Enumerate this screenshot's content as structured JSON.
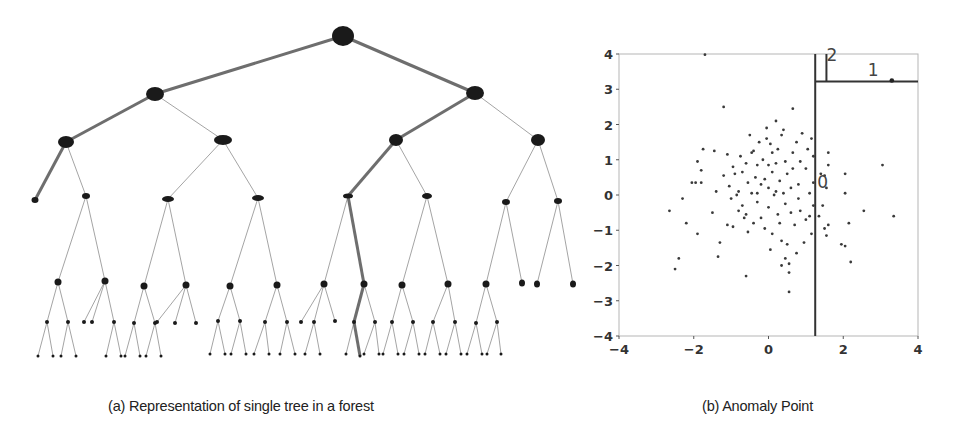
{
  "figure": {
    "caption_a": "(a) Representation of single tree in a forest",
    "caption_b": "(b) Anomaly Point"
  },
  "tree": {
    "description": "Binary isolation tree; highlighted (thick) paths show short path to isolated anomaly and deep path to normal point",
    "edge_color": "#9a9a9a",
    "highlight_color": "#6e6e6e",
    "node_color": "#1a1a1a",
    "nodes": [
      {
        "id": "r",
        "x": 343,
        "y": 36,
        "rx": 11,
        "ry": 10
      },
      {
        "id": "a",
        "x": 155,
        "y": 94,
        "rx": 9,
        "ry": 7,
        "parent": "r",
        "hl": true
      },
      {
        "id": "b",
        "x": 475,
        "y": 93,
        "rx": 9,
        "ry": 7,
        "parent": "r",
        "hl": true
      },
      {
        "id": "aa",
        "x": 66,
        "y": 142,
        "rx": 8,
        "ry": 6,
        "parent": "a",
        "hl": true
      },
      {
        "id": "ab",
        "x": 223,
        "y": 140,
        "rx": 9,
        "ry": 5,
        "parent": "a"
      },
      {
        "id": "ba",
        "x": 396,
        "y": 140,
        "rx": 7,
        "ry": 6,
        "parent": "b",
        "hl": true
      },
      {
        "id": "bb",
        "x": 538,
        "y": 140,
        "rx": 7,
        "ry": 6,
        "parent": "b"
      },
      {
        "id": "aaa",
        "x": 35,
        "y": 200,
        "rx": 3.5,
        "ry": 3,
        "parent": "aa",
        "hl": true
      },
      {
        "id": "aab",
        "x": 86,
        "y": 196,
        "rx": 4,
        "ry": 3,
        "parent": "aa"
      },
      {
        "id": "aba",
        "x": 168,
        "y": 199,
        "rx": 6,
        "ry": 3,
        "parent": "ab"
      },
      {
        "id": "abb",
        "x": 258,
        "y": 198,
        "rx": 6,
        "ry": 3,
        "parent": "ab"
      },
      {
        "id": "baa",
        "x": 348,
        "y": 196,
        "rx": 5,
        "ry": 2.5,
        "parent": "ba",
        "hl": true
      },
      {
        "id": "bab",
        "x": 427,
        "y": 196,
        "rx": 5,
        "ry": 3,
        "parent": "ba"
      },
      {
        "id": "bba",
        "x": 506,
        "y": 202,
        "rx": 4,
        "ry": 3,
        "parent": "bb"
      },
      {
        "id": "bbb",
        "x": 558,
        "y": 201,
        "rx": 4,
        "ry": 3,
        "parent": "bb"
      },
      {
        "id": "n1",
        "x": 58,
        "y": 282,
        "rx": 3.5,
        "ry": 3.5,
        "parent": "aab"
      },
      {
        "id": "n2",
        "x": 105,
        "y": 281,
        "rx": 3.5,
        "ry": 3.5,
        "parent": "aab"
      },
      {
        "id": "n3",
        "x": 144,
        "y": 286,
        "rx": 3.5,
        "ry": 3.5,
        "parent": "aba"
      },
      {
        "id": "n4",
        "x": 186,
        "y": 285,
        "rx": 3.5,
        "ry": 3.5,
        "parent": "aba"
      },
      {
        "id": "n5",
        "x": 230,
        "y": 286,
        "rx": 3.5,
        "ry": 3.5,
        "parent": "abb"
      },
      {
        "id": "n6",
        "x": 277,
        "y": 285,
        "rx": 3.5,
        "ry": 3.5,
        "parent": "abb"
      },
      {
        "id": "n7",
        "x": 324,
        "y": 284,
        "rx": 3.5,
        "ry": 3.5,
        "parent": "baa"
      },
      {
        "id": "n8",
        "x": 364,
        "y": 284,
        "rx": 3.5,
        "ry": 3.5,
        "parent": "baa",
        "hl": true
      },
      {
        "id": "n9",
        "x": 402,
        "y": 285,
        "rx": 3.5,
        "ry": 3.5,
        "parent": "bab"
      },
      {
        "id": "n10",
        "x": 448,
        "y": 284,
        "rx": 3.5,
        "ry": 3.5,
        "parent": "bab"
      },
      {
        "id": "n11",
        "x": 486,
        "y": 284,
        "rx": 3.5,
        "ry": 3.5,
        "parent": "bba"
      },
      {
        "id": "n12",
        "x": 522,
        "y": 283,
        "rx": 3,
        "ry": 3.5,
        "parent": "bba"
      },
      {
        "id": "n13",
        "x": 537,
        "y": 284,
        "rx": 3,
        "ry": 3.5,
        "parent": "bbb"
      },
      {
        "id": "n14",
        "x": 573,
        "y": 284,
        "rx": 3,
        "ry": 3.5,
        "parent": "bbb"
      },
      {
        "id": "m1",
        "x": 47,
        "y": 322,
        "r": 2,
        "parent": "n1"
      },
      {
        "id": "m2",
        "x": 68,
        "y": 322,
        "r": 2,
        "parent": "n1"
      },
      {
        "id": "m3",
        "x": 92,
        "y": 322,
        "r": 2,
        "parent": "n2"
      },
      {
        "id": "m4",
        "x": 114,
        "y": 322,
        "r": 2,
        "parent": "n2"
      },
      {
        "id": "m5",
        "x": 134,
        "y": 323,
        "r": 2,
        "parent": "n3"
      },
      {
        "id": "m6",
        "x": 155,
        "y": 323,
        "r": 2,
        "parent": "n3"
      },
      {
        "id": "m7",
        "x": 175,
        "y": 323,
        "r": 2,
        "parent": "n4"
      },
      {
        "id": "m8",
        "x": 196,
        "y": 323,
        "r": 2,
        "parent": "n4"
      },
      {
        "id": "m9",
        "x": 218,
        "y": 321,
        "r": 2,
        "parent": "n5"
      },
      {
        "id": "m10",
        "x": 240,
        "y": 321,
        "r": 2,
        "parent": "n5"
      },
      {
        "id": "m11",
        "x": 265,
        "y": 322,
        "r": 2,
        "parent": "n6"
      },
      {
        "id": "m12",
        "x": 287,
        "y": 322,
        "r": 2,
        "parent": "n6"
      },
      {
        "id": "m13",
        "x": 314,
        "y": 322,
        "r": 2,
        "parent": "n7"
      },
      {
        "id": "m14",
        "x": 335,
        "y": 321,
        "r": 2,
        "parent": "n7"
      },
      {
        "id": "m15",
        "x": 354,
        "y": 322,
        "r": 2,
        "parent": "n8",
        "hl": true
      },
      {
        "id": "m16",
        "x": 375,
        "y": 322,
        "r": 2,
        "parent": "n8"
      },
      {
        "id": "m17",
        "x": 392,
        "y": 322,
        "r": 2,
        "parent": "n9"
      },
      {
        "id": "m18",
        "x": 413,
        "y": 322,
        "r": 2,
        "parent": "n9"
      },
      {
        "id": "m19",
        "x": 433,
        "y": 322,
        "r": 2,
        "parent": "n10"
      },
      {
        "id": "m20",
        "x": 455,
        "y": 322,
        "r": 2,
        "parent": "n10"
      },
      {
        "id": "m21",
        "x": 476,
        "y": 323,
        "r": 2,
        "parent": "n11"
      },
      {
        "id": "m22",
        "x": 497,
        "y": 322,
        "r": 2,
        "parent": "n11"
      },
      {
        "id": "k1",
        "x": 38,
        "y": 356,
        "r": 1.5,
        "parent": "m1"
      },
      {
        "id": "k2",
        "x": 53,
        "y": 356,
        "r": 1.5,
        "parent": "m1"
      },
      {
        "id": "k3",
        "x": 61,
        "y": 356,
        "r": 1.5,
        "parent": "m2"
      },
      {
        "id": "k4",
        "x": 76,
        "y": 356,
        "r": 1.5,
        "parent": "m2"
      },
      {
        "id": "k5",
        "x": 106,
        "y": 356,
        "r": 1.5,
        "parent": "m4"
      },
      {
        "id": "k6",
        "x": 121,
        "y": 356,
        "r": 1.5,
        "parent": "m4"
      },
      {
        "id": "k7",
        "x": 125,
        "y": 356,
        "r": 1.5,
        "parent": "m5"
      },
      {
        "id": "k8",
        "x": 140,
        "y": 356,
        "r": 1.5,
        "parent": "m5"
      },
      {
        "id": "k9",
        "x": 146,
        "y": 356,
        "r": 1.5,
        "parent": "m6"
      },
      {
        "id": "k10",
        "x": 161,
        "y": 356,
        "r": 1.5,
        "parent": "m6"
      },
      {
        "id": "k11",
        "x": 210,
        "y": 354,
        "r": 1.5,
        "parent": "m9"
      },
      {
        "id": "k12",
        "x": 225,
        "y": 354,
        "r": 1.5,
        "parent": "m9"
      },
      {
        "id": "k13",
        "x": 231,
        "y": 354,
        "r": 1.5,
        "parent": "m10"
      },
      {
        "id": "k14",
        "x": 246,
        "y": 354,
        "r": 1.5,
        "parent": "m10"
      },
      {
        "id": "k15",
        "x": 254,
        "y": 354,
        "r": 1.5,
        "parent": "m11"
      },
      {
        "id": "k16",
        "x": 269,
        "y": 354,
        "r": 1.5,
        "parent": "m11"
      },
      {
        "id": "k17",
        "x": 280,
        "y": 354,
        "r": 1.5,
        "parent": "m12"
      },
      {
        "id": "k18",
        "x": 295,
        "y": 354,
        "r": 1.5,
        "parent": "m12"
      },
      {
        "id": "k19",
        "x": 305,
        "y": 354,
        "r": 1.5,
        "parent": "m13"
      },
      {
        "id": "k20",
        "x": 320,
        "y": 354,
        "r": 1.5,
        "parent": "m13"
      },
      {
        "id": "k21",
        "x": 346,
        "y": 354,
        "r": 1.5,
        "parent": "m15"
      },
      {
        "id": "k22",
        "x": 360,
        "y": 356,
        "r": 1.5,
        "parent": "m15",
        "hl": true
      },
      {
        "id": "k23",
        "x": 364,
        "y": 354,
        "r": 1.5,
        "parent": "m16"
      },
      {
        "id": "k24",
        "x": 379,
        "y": 354,
        "r": 1.5,
        "parent": "m16"
      },
      {
        "id": "k25",
        "x": 383,
        "y": 354,
        "r": 1.5,
        "parent": "m17"
      },
      {
        "id": "k26",
        "x": 398,
        "y": 354,
        "r": 1.5,
        "parent": "m17"
      },
      {
        "id": "k27",
        "x": 404,
        "y": 354,
        "r": 1.5,
        "parent": "m18"
      },
      {
        "id": "k28",
        "x": 419,
        "y": 354,
        "r": 1.5,
        "parent": "m18"
      },
      {
        "id": "k29",
        "x": 425,
        "y": 354,
        "r": 1.5,
        "parent": "m19"
      },
      {
        "id": "k30",
        "x": 440,
        "y": 354,
        "r": 1.5,
        "parent": "m19"
      },
      {
        "id": "k31",
        "x": 446,
        "y": 354,
        "r": 1.5,
        "parent": "m20"
      },
      {
        "id": "k32",
        "x": 461,
        "y": 354,
        "r": 1.5,
        "parent": "m20"
      },
      {
        "id": "k33",
        "x": 467,
        "y": 354,
        "r": 1.5,
        "parent": "m21"
      },
      {
        "id": "k34",
        "x": 482,
        "y": 354,
        "r": 1.5,
        "parent": "m21"
      },
      {
        "id": "k35",
        "x": 487,
        "y": 354,
        "r": 1.5,
        "parent": "m22"
      },
      {
        "id": "k36",
        "x": 501,
        "y": 354,
        "r": 1.5,
        "parent": "m22"
      }
    ],
    "extra_leaves": [
      {
        "x": 84,
        "y": 322,
        "r": 2,
        "parent": "n2_left_leaf_offset",
        "from": "n2"
      },
      {
        "x": 157,
        "y": 322,
        "r": 2,
        "from": "n4"
      },
      {
        "x": 301,
        "y": 322,
        "r": 2,
        "from": "n7"
      }
    ]
  },
  "chart_data": {
    "type": "scatter",
    "title": "(b) Anomaly Point",
    "xlabel": "",
    "ylabel": "",
    "xlim": [
      -4,
      4
    ],
    "ylim": [
      -4,
      4
    ],
    "xticks": [
      -4,
      -2,
      0,
      2,
      4
    ],
    "yticks": [
      -4,
      -3,
      -2,
      -1,
      0,
      1,
      2,
      3,
      4
    ],
    "grid": false,
    "legend": null,
    "split_lines": [
      {
        "type": "vertical",
        "x": 1.25,
        "y_from": -4,
        "y_to": 4,
        "label": "0"
      },
      {
        "type": "horizontal",
        "y": 3.22,
        "x_from": 1.25,
        "x_to": 4,
        "label": "1"
      },
      {
        "type": "vertical",
        "x": 1.55,
        "y_from": 3.22,
        "y_to": 4,
        "label": "2"
      }
    ],
    "annotations": [
      {
        "text": "0",
        "x": 1.45,
        "y": 0.2
      },
      {
        "text": "1",
        "x": 2.8,
        "y": 3.38
      },
      {
        "text": "2",
        "x": 1.7,
        "y": 3.8
      }
    ],
    "anomaly_point": {
      "x": 3.3,
      "y": 3.25
    },
    "points": [
      [
        -1.7,
        3.98
      ],
      [
        -1.2,
        2.5
      ],
      [
        0.65,
        2.45
      ],
      [
        -2.65,
        -0.45
      ],
      [
        -2.5,
        -2.1
      ],
      [
        -2.4,
        -1.8
      ],
      [
        -2.2,
        -0.8
      ],
      [
        -2.3,
        -0.1
      ],
      [
        -2.05,
        0.35
      ],
      [
        -1.95,
        0.35
      ],
      [
        -1.8,
        0.35
      ],
      [
        -1.9,
        0.95
      ],
      [
        -1.8,
        0.7
      ],
      [
        -1.75,
        1.3
      ],
      [
        -1.9,
        -1.1
      ],
      [
        -1.45,
        1.25
      ],
      [
        -1.5,
        -0.5
      ],
      [
        -1.4,
        0.1
      ],
      [
        -1.3,
        -1.35
      ],
      [
        -1.35,
        -1.75
      ],
      [
        -1.2,
        0.55
      ],
      [
        -1.1,
        1.15
      ],
      [
        -1.05,
        0.25
      ],
      [
        -1.0,
        -0.1
      ],
      [
        -0.95,
        0.8
      ],
      [
        -0.95,
        -0.9
      ],
      [
        -0.9,
        0.6
      ],
      [
        -0.85,
        0.0
      ],
      [
        -0.8,
        -0.45
      ],
      [
        -0.75,
        1.1
      ],
      [
        -0.7,
        0.65
      ],
      [
        -0.7,
        -0.3
      ],
      [
        -0.6,
        0.9
      ],
      [
        -0.6,
        -0.55
      ],
      [
        -0.55,
        -1.05
      ],
      [
        -0.55,
        0.35
      ],
      [
        -0.5,
        1.7
      ],
      [
        -0.45,
        1.2
      ],
      [
        -0.45,
        0.05
      ],
      [
        -0.4,
        -0.8
      ],
      [
        -0.35,
        0.5
      ],
      [
        -0.3,
        0.85
      ],
      [
        -0.3,
        -0.2
      ],
      [
        -0.25,
        1.5
      ],
      [
        -0.2,
        0.3
      ],
      [
        -0.2,
        -0.65
      ],
      [
        -0.15,
        1.0
      ],
      [
        -0.1,
        0.45
      ],
      [
        -0.1,
        -0.95
      ],
      [
        -0.05,
        1.9
      ],
      [
        0.0,
        0.2
      ],
      [
        0.0,
        -0.35
      ],
      [
        0.05,
        -1.55
      ],
      [
        0.05,
        1.45
      ],
      [
        0.1,
        0.65
      ],
      [
        0.1,
        -1.1
      ],
      [
        0.15,
        0.0
      ],
      [
        0.2,
        0.9
      ],
      [
        0.2,
        2.1
      ],
      [
        0.25,
        -0.55
      ],
      [
        0.25,
        1.3
      ],
      [
        0.3,
        0.4
      ],
      [
        0.3,
        -0.8
      ],
      [
        0.35,
        1.7
      ],
      [
        0.35,
        -1.3
      ],
      [
        0.4,
        0.05
      ],
      [
        0.4,
        1.85
      ],
      [
        0.45,
        -0.25
      ],
      [
        0.45,
        0.95
      ],
      [
        0.5,
        -1.4
      ],
      [
        0.5,
        0.6
      ],
      [
        0.55,
        -1.95
      ],
      [
        0.55,
        -2.2
      ],
      [
        0.55,
        -2.75
      ],
      [
        0.6,
        0.2
      ],
      [
        0.6,
        -0.5
      ],
      [
        0.65,
        1.2
      ],
      [
        0.7,
        -0.85
      ],
      [
        0.75,
        1.5
      ],
      [
        0.75,
        -1.65
      ],
      [
        0.8,
        0.3
      ],
      [
        0.8,
        -0.1
      ],
      [
        0.85,
        0.95
      ],
      [
        0.85,
        -0.45
      ],
      [
        0.9,
        1.75
      ],
      [
        0.95,
        -1.35
      ],
      [
        1.0,
        0.75
      ],
      [
        1.0,
        -0.7
      ],
      [
        1.05,
        1.3
      ],
      [
        1.1,
        0.05
      ],
      [
        1.1,
        -0.6
      ],
      [
        1.15,
        1.6
      ],
      [
        1.15,
        -1.1
      ],
      [
        1.2,
        0.35
      ],
      [
        1.2,
        -0.3
      ],
      [
        1.2,
        1.1
      ],
      [
        -0.6,
        -2.3
      ],
      [
        0.35,
        -2.0
      ],
      [
        0.45,
        -1.8
      ],
      [
        -0.8,
        0.1
      ],
      [
        -0.65,
        -0.65
      ],
      [
        0.0,
        0.85
      ],
      [
        0.2,
        0.1
      ],
      [
        -0.3,
        0.05
      ],
      [
        1.35,
        -0.6
      ],
      [
        1.4,
        0.6
      ],
      [
        1.45,
        -0.3
      ],
      [
        1.5,
        0.55
      ],
      [
        1.55,
        -1.15
      ],
      [
        1.6,
        0.85
      ],
      [
        1.6,
        -0.85
      ],
      [
        1.6,
        1.2
      ],
      [
        1.55,
        0.2
      ],
      [
        1.5,
        -0.95
      ],
      [
        2.05,
        0.6
      ],
      [
        2.05,
        0.05
      ],
      [
        2.05,
        -1.45
      ],
      [
        2.15,
        -0.8
      ],
      [
        2.2,
        -1.9
      ],
      [
        1.95,
        -1.4
      ],
      [
        2.55,
        -0.45
      ],
      [
        3.05,
        0.85
      ],
      [
        3.35,
        -0.6
      ],
      [
        -1.1,
        -0.85
      ],
      [
        -0.05,
        1.6
      ],
      [
        -0.4,
        1.25
      ],
      [
        0.1,
        1.2
      ],
      [
        0.65,
        0.75
      ]
    ]
  }
}
